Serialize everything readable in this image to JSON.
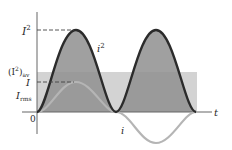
{
  "figure": {
    "labels": {
      "i_squared_peak": "I",
      "i_squared_peak_sup": "2",
      "avg_open": "(I",
      "avg_sup": "2",
      "avg_close": ")",
      "avg_sub": "av",
      "I_peak": "I",
      "I_rms": "I",
      "I_rms_sub": "rms",
      "origin": "0",
      "time_axis": "t",
      "curve_i_squared": "i",
      "curve_i_squared_sup": "2",
      "curve_i": "i"
    },
    "colors": {
      "axis": "#555555",
      "i_squared_curve": "#2b2b2b",
      "i_squared_fill": "#8f8f8f",
      "average_band": "#d3d3d3",
      "i_curve": "#b5b5b5",
      "dashed": "#444444"
    }
  }
}
